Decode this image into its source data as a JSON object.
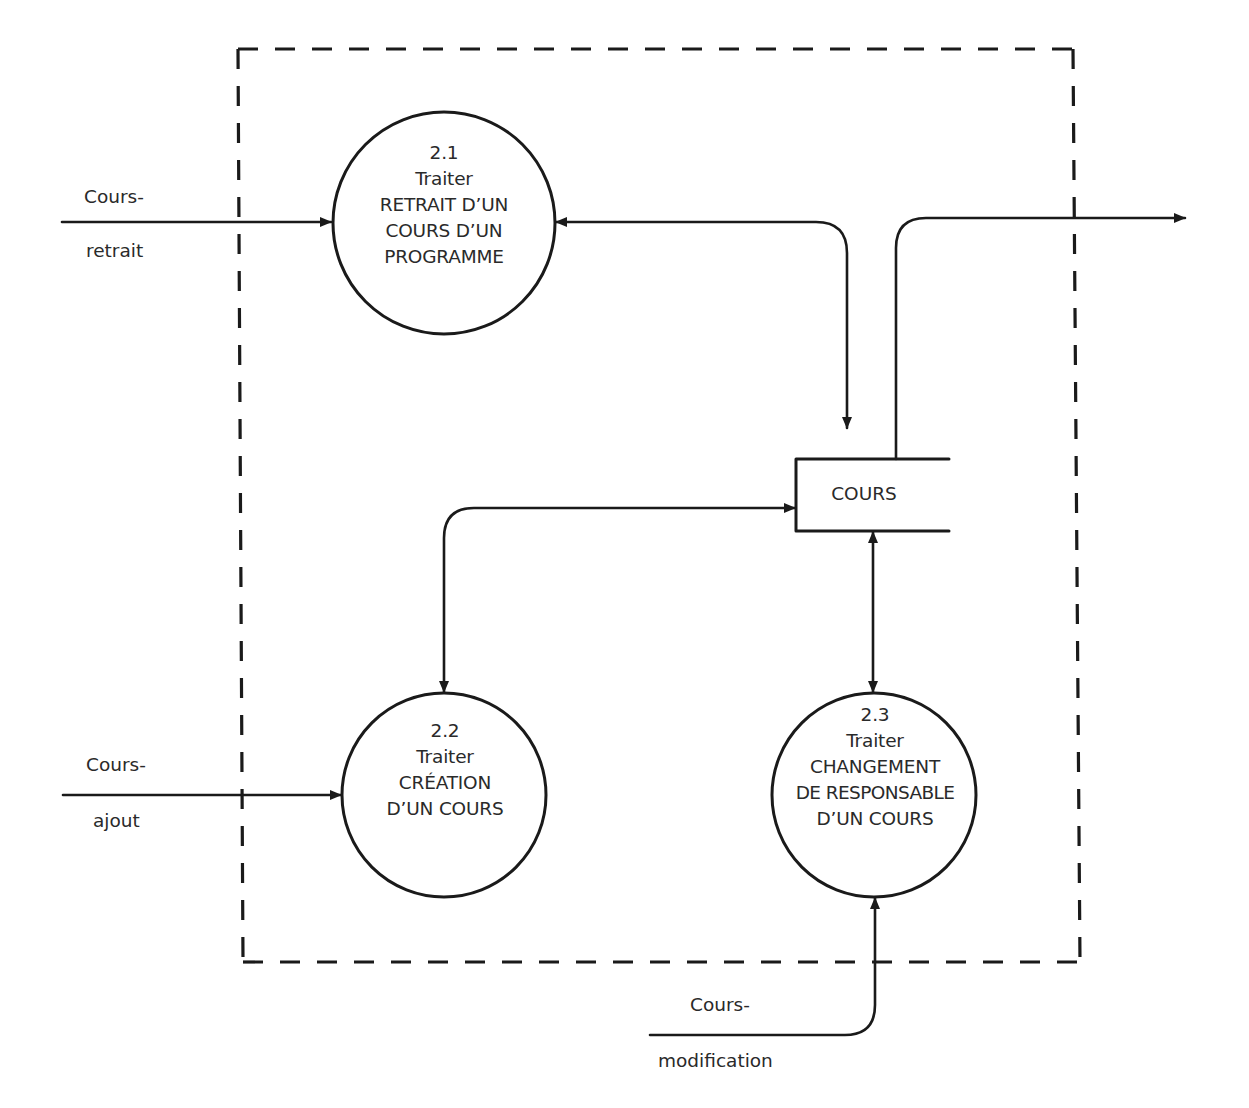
{
  "diagram": {
    "type": "data-flow-diagram",
    "boundary": {
      "style": "dashed"
    },
    "processes": [
      {
        "id": "2.1",
        "number": "2.1",
        "lines": [
          "Traiter",
          "RETRAIT D’UN",
          "COURS D’UN",
          "PROGRAMME"
        ]
      },
      {
        "id": "2.2",
        "number": "2.2",
        "lines": [
          "Traiter",
          "CRÉATION",
          "D’UN COURS"
        ]
      },
      {
        "id": "2.3",
        "number": "2.3",
        "lines": [
          "Traiter",
          "CHANGEMENT",
          "DE RESPONSABLE",
          "D’UN COURS"
        ]
      }
    ],
    "data_store": {
      "label": "COURS"
    },
    "flows": [
      {
        "from": "external",
        "to": "2.1",
        "label_top": "Cours-",
        "label_bottom": "retrait"
      },
      {
        "from": "external",
        "to": "2.2",
        "label_top": "Cours-",
        "label_bottom": "ajout"
      },
      {
        "from": "external",
        "to": "2.3",
        "label_top": "Cours-",
        "label_bottom": "modification"
      },
      {
        "from": "COURS",
        "to": "2.1",
        "label_top": "",
        "label_bottom": ""
      },
      {
        "from": "2.1",
        "to": "COURS",
        "label_top": "",
        "label_bottom": ""
      },
      {
        "from": "COURS",
        "to": "2.2",
        "bidirectional": true,
        "label_top": "",
        "label_bottom": ""
      },
      {
        "from": "COURS",
        "to": "2.3",
        "bidirectional": true,
        "label_top": "",
        "label_bottom": ""
      },
      {
        "from": "COURS",
        "to": "external",
        "label_top": "",
        "label_bottom": ""
      }
    ]
  },
  "colors": {
    "ink": "#1a1a1a",
    "text": "#2a2a2a",
    "background": "#ffffff"
  }
}
